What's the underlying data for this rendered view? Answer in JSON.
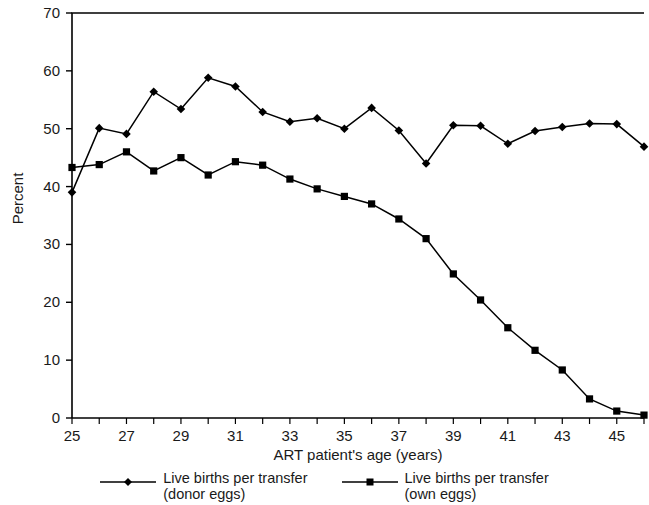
{
  "chart_data": {
    "type": "line",
    "title": "",
    "xlabel": "ART patient's age (years)",
    "ylabel": "Percent",
    "xlim": [
      25,
      46
    ],
    "ylim": [
      0,
      70
    ],
    "yticks": [
      0,
      10,
      20,
      30,
      40,
      50,
      60,
      70
    ],
    "xticks": [
      25,
      27,
      29,
      31,
      33,
      35,
      37,
      39,
      41,
      43,
      45
    ],
    "x": [
      25,
      26,
      27,
      28,
      29,
      30,
      31,
      32,
      33,
      34,
      35,
      36,
      37,
      38,
      39,
      40,
      41,
      42,
      43,
      44,
      45,
      46
    ],
    "grid": false,
    "legend_position": "bottom",
    "series": [
      {
        "name": "Live births per transfer (donor eggs)",
        "marker": "diamond",
        "color": "#000000",
        "values": [
          39.0,
          50.1,
          49.1,
          56.4,
          53.4,
          58.8,
          57.3,
          52.9,
          51.2,
          51.8,
          50.0,
          53.6,
          49.7,
          44.0,
          50.6,
          50.5,
          47.4,
          49.6,
          50.3,
          50.9,
          50.8,
          46.9
        ]
      },
      {
        "name": "Live births per transfer (own eggs)",
        "marker": "square",
        "color": "#000000",
        "values": [
          43.3,
          43.8,
          46.0,
          42.7,
          45.0,
          42.0,
          44.3,
          43.7,
          41.3,
          39.6,
          38.3,
          37.0,
          34.4,
          31.0,
          24.9,
          20.4,
          15.6,
          11.7,
          8.3,
          3.3,
          1.2,
          0.5
        ]
      }
    ]
  },
  "axis": {
    "ylabel": "Percent",
    "xlabel": "ART patient's age (years)",
    "ytick_labels": [
      "70",
      "60",
      "50",
      "40",
      "30",
      "20",
      "10",
      "0"
    ],
    "xtick_labels": [
      "25",
      "27",
      "29",
      "31",
      "33",
      "35",
      "37",
      "39",
      "41",
      "43",
      "45"
    ]
  },
  "legend": {
    "entries": [
      {
        "label": "Live births per transfer\n(donor eggs)",
        "marker": "diamond-marker-icon"
      },
      {
        "label": "Live births per transfer\n(own eggs)",
        "marker": "square-marker-icon"
      }
    ]
  }
}
